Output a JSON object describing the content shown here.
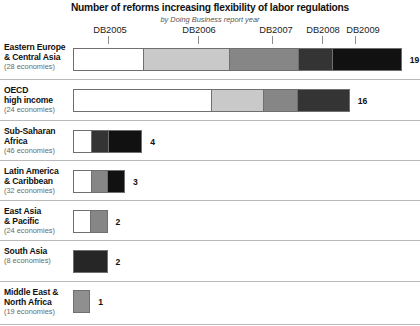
{
  "chart_data": {
    "type": "bar",
    "orientation": "horizontal",
    "stacked": true,
    "title": "Number of reforms increasing flexibility of labor regulations",
    "subtitle": "by Doing Business report year",
    "xlabel": "",
    "ylabel": "",
    "grid": false,
    "legend_position": "top",
    "axis_labels": [
      "DB2005",
      "DB2006",
      "DB2007",
      "DB2008",
      "DB2009"
    ],
    "series": [
      {
        "name": "DB2005",
        "color": "#ffffff",
        "values": [
          4,
          8,
          1,
          1,
          1,
          0,
          0
        ]
      },
      {
        "name": "DB2006",
        "color": "#c9c9c9",
        "values": [
          5,
          3,
          0,
          0,
          0,
          0,
          1
        ]
      },
      {
        "name": "DB2007",
        "color": "#868686",
        "values": [
          4,
          2,
          0,
          1,
          1,
          0,
          0
        ]
      },
      {
        "name": "DB2008",
        "color": "#343434",
        "values": [
          2,
          3,
          1,
          0,
          0,
          0,
          0
        ]
      },
      {
        "name": "DB2009",
        "color": "#111111",
        "values": [
          4,
          0,
          2,
          1,
          0,
          2,
          0
        ]
      }
    ],
    "categories": [
      "Eastern Europe & Central Asia",
      "OECD high income",
      "Sub-Saharan Africa",
      "Latin America & Caribbean",
      "East Asia & Pacific",
      "South Asia",
      "Middle East & North Africa"
    ],
    "totals": [
      19,
      16,
      4,
      3,
      2,
      2,
      1
    ],
    "unit_px": 17.3,
    "xlim": [
      0,
      19
    ]
  },
  "header": {
    "title": "Number of reforms increasing flexibility of labor regulations",
    "subtitle": "by Doing Business report year"
  },
  "year_ticks": [
    {
      "label": "DB2005",
      "label_x": 110,
      "tick_x": 108
    },
    {
      "label": "DB2006",
      "label_x": 199,
      "tick_x": 198
    },
    {
      "label": "DB2007",
      "label_x": 276,
      "tick_x": 272
    },
    {
      "label": "DB2008",
      "label_x": 323,
      "tick_x": 322
    },
    {
      "label": "DB2009",
      "label_x": 363,
      "tick_x": 355
    }
  ],
  "rows": [
    {
      "name_line1": "Eastern Europe",
      "name_line2": "& Central Asia",
      "economies": "(28 economies)",
      "total": "19",
      "segments": [
        {
          "year": "DB2005",
          "value": 4,
          "color": "#ffffff"
        },
        {
          "year": "DB2006",
          "value": 5,
          "color": "#c9c9c9"
        },
        {
          "year": "DB2007",
          "value": 4,
          "color": "#868686"
        },
        {
          "year": "DB2008",
          "value": 2,
          "color": "#343434"
        },
        {
          "year": "DB2009",
          "value": 4,
          "color": "#111111"
        }
      ]
    },
    {
      "name_line1": "OECD",
      "name_line2": "high income",
      "economies": "(24 economies)",
      "total": "16",
      "segments": [
        {
          "year": "DB2005",
          "value": 8,
          "color": "#ffffff"
        },
        {
          "year": "DB2006",
          "value": 3,
          "color": "#c9c9c9"
        },
        {
          "year": "DB2007",
          "value": 2,
          "color": "#868686"
        },
        {
          "year": "DB2008",
          "value": 3,
          "color": "#343434"
        }
      ]
    },
    {
      "name_line1": "Sub-Saharan",
      "name_line2": "Africa",
      "economies": "(46 economies)",
      "total": "4",
      "segments": [
        {
          "year": "DB2005",
          "value": 1,
          "color": "#ffffff"
        },
        {
          "year": "DB2008",
          "value": 1,
          "color": "#343434"
        },
        {
          "year": "DB2009",
          "value": 2,
          "color": "#111111"
        }
      ]
    },
    {
      "name_line1": "Latin America",
      "name_line2": "& Caribbean",
      "economies": "(32 economies)",
      "total": "3",
      "segments": [
        {
          "year": "DB2005",
          "value": 1,
          "color": "#ffffff"
        },
        {
          "year": "DB2007",
          "value": 1,
          "color": "#868686"
        },
        {
          "year": "DB2009",
          "value": 1,
          "color": "#111111"
        }
      ]
    },
    {
      "name_line1": "East Asia",
      "name_line2": "& Pacific",
      "economies": "(24 economies)",
      "total": "2",
      "segments": [
        {
          "year": "DB2005",
          "value": 1,
          "color": "#ffffff"
        },
        {
          "year": "DB2007",
          "value": 1,
          "color": "#868686"
        }
      ]
    },
    {
      "name_line1": "South Asia",
      "name_line2": "",
      "economies": "(8 economies)",
      "total": "2",
      "segments": [
        {
          "year": "DB2009",
          "value": 2,
          "color": "#262626"
        }
      ]
    },
    {
      "name_line1": "Middle East &",
      "name_line2": "North Africa",
      "economies": "(19 economies)",
      "total": "1",
      "segments": [
        {
          "year": "DB2006",
          "value": 1,
          "color": "#8f8f8f"
        }
      ]
    }
  ]
}
